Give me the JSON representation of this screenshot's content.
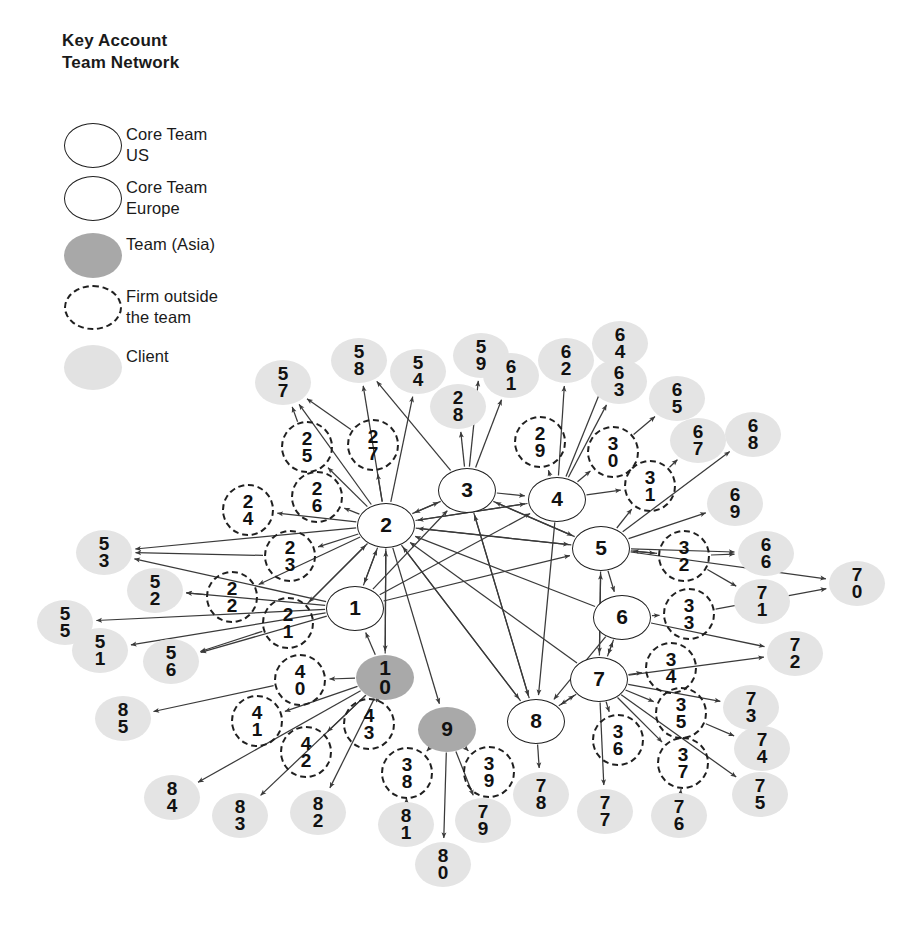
{
  "title": "Key Account\nTeam Network",
  "legend": {
    "items": [
      {
        "symbol": "core-us-circle",
        "label": "Core Team\nUS"
      },
      {
        "symbol": "core-europe-circle",
        "label": "Core Team\nEurope"
      },
      {
        "symbol": "team-asia-circle",
        "label": "Team (Asia)"
      },
      {
        "symbol": "firm-outside-dashed-circle",
        "label": "Firm outside\nthe team"
      },
      {
        "symbol": "client-circle",
        "label": "Client"
      }
    ]
  },
  "colors": {
    "core_fill": "#ffffff",
    "core_stroke": "#1f1f1f",
    "asia_fill": "#a9a9a9",
    "client_fill": "#e4e4e4",
    "firm_stroke": "#1f1f1f",
    "edge": "#3a3a3a",
    "text": "#111111"
  },
  "chart_data": {
    "type": "diagram",
    "title": "Key Account Team Network",
    "node_kinds": [
      "core-us",
      "core-europe",
      "team-asia",
      "firm-outside",
      "client"
    ],
    "nodes": [
      {
        "id": "1",
        "label": "1",
        "kind": "core-us",
        "x": 355,
        "y": 608
      },
      {
        "id": "2",
        "label": "2",
        "kind": "core-us",
        "x": 386,
        "y": 525
      },
      {
        "id": "3",
        "label": "3",
        "kind": "core-europe",
        "x": 467,
        "y": 490
      },
      {
        "id": "4",
        "label": "4",
        "kind": "core-europe",
        "x": 557,
        "y": 499
      },
      {
        "id": "5",
        "label": "5",
        "kind": "core-europe",
        "x": 601,
        "y": 548
      },
      {
        "id": "6",
        "label": "6",
        "kind": "core-europe",
        "x": 622,
        "y": 617
      },
      {
        "id": "7",
        "label": "7",
        "kind": "core-europe",
        "x": 599,
        "y": 679
      },
      {
        "id": "8",
        "label": "8",
        "kind": "core-europe",
        "x": 536,
        "y": 721
      },
      {
        "id": "9",
        "label": "9",
        "kind": "team-asia",
        "x": 447,
        "y": 729
      },
      {
        "id": "10",
        "label": "1\n0",
        "kind": "team-asia",
        "x": 385,
        "y": 677
      },
      {
        "id": "21",
        "label": "2\n1",
        "kind": "firm-outside",
        "x": 288,
        "y": 623
      },
      {
        "id": "22",
        "label": "2\n2",
        "kind": "firm-outside",
        "x": 232,
        "y": 597
      },
      {
        "id": "23",
        "label": "2\n3",
        "kind": "firm-outside",
        "x": 290,
        "y": 556
      },
      {
        "id": "24",
        "label": "2\n4",
        "kind": "firm-outside",
        "x": 248,
        "y": 510
      },
      {
        "id": "25",
        "label": "2\n5",
        "kind": "firm-outside",
        "x": 307,
        "y": 447
      },
      {
        "id": "26",
        "label": "2\n6",
        "kind": "firm-outside",
        "x": 317,
        "y": 497
      },
      {
        "id": "27",
        "label": "2\n7",
        "kind": "firm-outside",
        "x": 373,
        "y": 445
      },
      {
        "id": "29",
        "label": "2\n9",
        "kind": "firm-outside",
        "x": 540,
        "y": 442
      },
      {
        "id": "30",
        "label": "3\n0",
        "kind": "firm-outside",
        "x": 613,
        "y": 452
      },
      {
        "id": "31",
        "label": "3\n1",
        "kind": "firm-outside",
        "x": 650,
        "y": 486
      },
      {
        "id": "32",
        "label": "3\n2",
        "kind": "firm-outside",
        "x": 684,
        "y": 556
      },
      {
        "id": "33",
        "label": "3\n3",
        "kind": "firm-outside",
        "x": 689,
        "y": 614
      },
      {
        "id": "34",
        "label": "3\n4",
        "kind": "firm-outside",
        "x": 671,
        "y": 668
      },
      {
        "id": "35",
        "label": "3\n5",
        "kind": "firm-outside",
        "x": 681,
        "y": 713
      },
      {
        "id": "36",
        "label": "3\n6",
        "kind": "firm-outside",
        "x": 618,
        "y": 740
      },
      {
        "id": "37",
        "label": "3\n7",
        "kind": "firm-outside",
        "x": 683,
        "y": 763
      },
      {
        "id": "38",
        "label": "3\n8",
        "kind": "firm-outside",
        "x": 407,
        "y": 773
      },
      {
        "id": "39",
        "label": "3\n9",
        "kind": "firm-outside",
        "x": 489,
        "y": 772
      },
      {
        "id": "40",
        "label": "4\n0",
        "kind": "firm-outside",
        "x": 300,
        "y": 680
      },
      {
        "id": "41",
        "label": "4\n1",
        "kind": "firm-outside",
        "x": 257,
        "y": 721
      },
      {
        "id": "42",
        "label": "4\n2",
        "kind": "firm-outside",
        "x": 306,
        "y": 752
      },
      {
        "id": "43",
        "label": "4\n3",
        "kind": "firm-outside",
        "x": 369,
        "y": 724
      },
      {
        "id": "51",
        "label": "5\n1",
        "kind": "client",
        "x": 100,
        "y": 650
      },
      {
        "id": "52",
        "label": "5\n2",
        "kind": "client",
        "x": 155,
        "y": 590
      },
      {
        "id": "53",
        "label": "5\n3",
        "kind": "client",
        "x": 104,
        "y": 552
      },
      {
        "id": "54",
        "label": "5\n4",
        "kind": "client",
        "x": 418,
        "y": 371
      },
      {
        "id": "55",
        "label": "5\n5",
        "kind": "client",
        "x": 65,
        "y": 622
      },
      {
        "id": "56",
        "label": "5\n6",
        "kind": "client",
        "x": 171,
        "y": 661
      },
      {
        "id": "57",
        "label": "5\n7",
        "kind": "client",
        "x": 283,
        "y": 382
      },
      {
        "id": "58",
        "label": "5\n8",
        "kind": "client",
        "x": 359,
        "y": 360
      },
      {
        "id": "59",
        "label": "5\n9",
        "kind": "client",
        "x": 481,
        "y": 355
      },
      {
        "id": "61",
        "label": "6\n1",
        "kind": "client",
        "x": 511,
        "y": 375
      },
      {
        "id": "28",
        "label": "2\n8",
        "kind": "client",
        "x": 458,
        "y": 406
      },
      {
        "id": "62",
        "label": "6\n2",
        "kind": "client",
        "x": 566,
        "y": 360
      },
      {
        "id": "63",
        "label": "6\n3",
        "kind": "client",
        "x": 619,
        "y": 381
      },
      {
        "id": "64",
        "label": "6\n4",
        "kind": "client",
        "x": 620,
        "y": 343
      },
      {
        "id": "65",
        "label": "6\n5",
        "kind": "client",
        "x": 677,
        "y": 398
      },
      {
        "id": "66",
        "label": "6\n6",
        "kind": "client",
        "x": 766,
        "y": 553
      },
      {
        "id": "67",
        "label": "6\n7",
        "kind": "client",
        "x": 698,
        "y": 440
      },
      {
        "id": "68",
        "label": "6\n8",
        "kind": "client",
        "x": 753,
        "y": 434
      },
      {
        "id": "69",
        "label": "6\n9",
        "kind": "client",
        "x": 735,
        "y": 503
      },
      {
        "id": "70",
        "label": "7\n0",
        "kind": "client",
        "x": 857,
        "y": 583
      },
      {
        "id": "71",
        "label": "7\n1",
        "kind": "client",
        "x": 762,
        "y": 601
      },
      {
        "id": "72",
        "label": "7\n2",
        "kind": "client",
        "x": 795,
        "y": 653
      },
      {
        "id": "73",
        "label": "7\n3",
        "kind": "client",
        "x": 751,
        "y": 707
      },
      {
        "id": "74",
        "label": "7\n4",
        "kind": "client",
        "x": 762,
        "y": 748
      },
      {
        "id": "75",
        "label": "7\n5",
        "kind": "client",
        "x": 760,
        "y": 794
      },
      {
        "id": "76",
        "label": "7\n6",
        "kind": "client",
        "x": 679,
        "y": 815
      },
      {
        "id": "77",
        "label": "7\n7",
        "kind": "client",
        "x": 605,
        "y": 811
      },
      {
        "id": "78",
        "label": "7\n8",
        "kind": "client",
        "x": 541,
        "y": 794
      },
      {
        "id": "79",
        "label": "7\n9",
        "kind": "client",
        "x": 483,
        "y": 820
      },
      {
        "id": "80",
        "label": "8\n0",
        "kind": "client",
        "x": 443,
        "y": 864
      },
      {
        "id": "81",
        "label": "8\n1",
        "kind": "client",
        "x": 406,
        "y": 824
      },
      {
        "id": "82",
        "label": "8\n2",
        "kind": "client",
        "x": 318,
        "y": 812
      },
      {
        "id": "83",
        "label": "8\n3",
        "kind": "client",
        "x": 240,
        "y": 815
      },
      {
        "id": "84",
        "label": "8\n4",
        "kind": "client",
        "x": 172,
        "y": 797
      },
      {
        "id": "85",
        "label": "8\n5",
        "kind": "client",
        "x": 123,
        "y": 718
      }
    ],
    "edges": [
      {
        "from": "1",
        "to": "2"
      },
      {
        "from": "2",
        "to": "1"
      },
      {
        "from": "1",
        "to": "3"
      },
      {
        "from": "3",
        "to": "2"
      },
      {
        "from": "2",
        "to": "3"
      },
      {
        "from": "2",
        "to": "4"
      },
      {
        "from": "4",
        "to": "2"
      },
      {
        "from": "5",
        "to": "2"
      },
      {
        "from": "2",
        "to": "5"
      },
      {
        "from": "6",
        "to": "2"
      },
      {
        "from": "7",
        "to": "2"
      },
      {
        "from": "8",
        "to": "3"
      },
      {
        "from": "2",
        "to": "8"
      },
      {
        "from": "2",
        "to": "10"
      },
      {
        "from": "2",
        "to": "9"
      },
      {
        "from": "3",
        "to": "5"
      },
      {
        "from": "3",
        "to": "8"
      },
      {
        "from": "4",
        "to": "8"
      },
      {
        "from": "5",
        "to": "6"
      },
      {
        "from": "5",
        "to": "7"
      },
      {
        "from": "6",
        "to": "7"
      },
      {
        "from": "7",
        "to": "8"
      },
      {
        "from": "8",
        "to": "7"
      },
      {
        "from": "6",
        "to": "8"
      },
      {
        "from": "1",
        "to": "4"
      },
      {
        "from": "1",
        "to": "5"
      },
      {
        "from": "10",
        "to": "1"
      },
      {
        "from": "3",
        "to": "4"
      },
      {
        "from": "7",
        "to": "5"
      },
      {
        "from": "7",
        "to": "6"
      },
      {
        "from": "8",
        "to": "2"
      },
      {
        "from": "5",
        "to": "3"
      },
      {
        "from": "2",
        "to": "24"
      },
      {
        "from": "2",
        "to": "26"
      },
      {
        "from": "2",
        "to": "25"
      },
      {
        "from": "2",
        "to": "27"
      },
      {
        "from": "2",
        "to": "23"
      },
      {
        "from": "2",
        "to": "22"
      },
      {
        "from": "2",
        "to": "21"
      },
      {
        "from": "21",
        "to": "2"
      },
      {
        "from": "2",
        "to": "57"
      },
      {
        "from": "2",
        "to": "58"
      },
      {
        "from": "25",
        "to": "57"
      },
      {
        "from": "27",
        "to": "57"
      },
      {
        "from": "2",
        "to": "54"
      },
      {
        "from": "3",
        "to": "59"
      },
      {
        "from": "3",
        "to": "61"
      },
      {
        "from": "3",
        "to": "28"
      },
      {
        "from": "3",
        "to": "58"
      },
      {
        "from": "4",
        "to": "29"
      },
      {
        "from": "4",
        "to": "62"
      },
      {
        "from": "4",
        "to": "63"
      },
      {
        "from": "4",
        "to": "64"
      },
      {
        "from": "4",
        "to": "30"
      },
      {
        "from": "30",
        "to": "65"
      },
      {
        "from": "4",
        "to": "31"
      },
      {
        "from": "5",
        "to": "31"
      },
      {
        "from": "31",
        "to": "67"
      },
      {
        "from": "5",
        "to": "68"
      },
      {
        "from": "5",
        "to": "69"
      },
      {
        "from": "5",
        "to": "32"
      },
      {
        "from": "32",
        "to": "5"
      },
      {
        "from": "32",
        "to": "66"
      },
      {
        "from": "32",
        "to": "71"
      },
      {
        "from": "5",
        "to": "70"
      },
      {
        "from": "5",
        "to": "66"
      },
      {
        "from": "6",
        "to": "33"
      },
      {
        "from": "33",
        "to": "70"
      },
      {
        "from": "6",
        "to": "72"
      },
      {
        "from": "7",
        "to": "34"
      },
      {
        "from": "7",
        "to": "72"
      },
      {
        "from": "7",
        "to": "73"
      },
      {
        "from": "7",
        "to": "35"
      },
      {
        "from": "35",
        "to": "74"
      },
      {
        "from": "7",
        "to": "75"
      },
      {
        "from": "7",
        "to": "36"
      },
      {
        "from": "7",
        "to": "37"
      },
      {
        "from": "37",
        "to": "76"
      },
      {
        "from": "7",
        "to": "77"
      },
      {
        "from": "8",
        "to": "78"
      },
      {
        "from": "9",
        "to": "38"
      },
      {
        "from": "9",
        "to": "39"
      },
      {
        "from": "9",
        "to": "79"
      },
      {
        "from": "9",
        "to": "80"
      },
      {
        "from": "38",
        "to": "81"
      },
      {
        "from": "10",
        "to": "43"
      },
      {
        "from": "10",
        "to": "42"
      },
      {
        "from": "10",
        "to": "40"
      },
      {
        "from": "10",
        "to": "41"
      },
      {
        "from": "10",
        "to": "82"
      },
      {
        "from": "10",
        "to": "83"
      },
      {
        "from": "10",
        "to": "84"
      },
      {
        "from": "40",
        "to": "85"
      },
      {
        "from": "1",
        "to": "53"
      },
      {
        "from": "1",
        "to": "52"
      },
      {
        "from": "1",
        "to": "55"
      },
      {
        "from": "1",
        "to": "51"
      },
      {
        "from": "1",
        "to": "56"
      },
      {
        "from": "22",
        "to": "52"
      },
      {
        "from": "23",
        "to": "53"
      },
      {
        "from": "2",
        "to": "53"
      },
      {
        "from": "21",
        "to": "56"
      },
      {
        "from": "10",
        "to": "2"
      },
      {
        "from": "43",
        "to": "10"
      }
    ],
    "legend_position": "top-left",
    "grid": false
  }
}
